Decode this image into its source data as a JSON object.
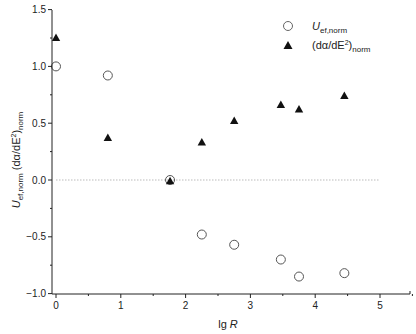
{
  "chart_data": {
    "type": "scatter",
    "title": "",
    "xlabel": "lg R",
    "ylabel": "U_ef,norm (dα/dE²)_norm",
    "xlim": [
      -0.1,
      5.5
    ],
    "ylim": [
      -1.0,
      1.5
    ],
    "xticks": [
      "0",
      "1",
      "2",
      "3",
      "4",
      "5"
    ],
    "yticks": [
      "1.5",
      "1.0",
      "0.5",
      "0.0",
      "-0.5",
      "-1.0"
    ],
    "grid": false,
    "reference_line": {
      "y": 0.0,
      "style": "dotted",
      "x_range": [
        0,
        5
      ]
    },
    "legend_position": "upper right",
    "series": [
      {
        "name": "U_ef,norm",
        "marker": "open-circle",
        "x": [
          0.0,
          0.8,
          1.76,
          2.25,
          2.75,
          3.47,
          3.75,
          4.45
        ],
        "y": [
          1.0,
          0.92,
          0.0,
          -0.48,
          -0.57,
          -0.7,
          -0.85,
          -0.82
        ]
      },
      {
        "name": "(dα/dE²)_norm",
        "marker": "filled-triangle",
        "x": [
          0.0,
          0.8,
          1.76,
          2.25,
          2.75,
          3.47,
          3.75,
          4.45
        ],
        "y": [
          1.25,
          0.37,
          -0.01,
          0.33,
          0.52,
          0.66,
          0.62,
          0.74
        ]
      }
    ]
  },
  "legend": {
    "items": [
      {
        "main": "U",
        "sub": "ef,norm",
        "marker": "open-circle"
      },
      {
        "main": "(dα/dE",
        "sup": "2",
        "close": ")",
        "sub": "norm",
        "marker": "filled-triangle"
      }
    ]
  },
  "axes": {
    "x_title_main": "lg ",
    "x_title_italic": "R",
    "y_title": {
      "u": "U",
      "u_sub": "ef,norm",
      "rest": " (dα/dE",
      "sup": "2",
      "close": ")",
      "sub": "norm"
    }
  },
  "colors": {
    "axis": "#222222",
    "marker": "#111111",
    "circle_stroke": "#555555",
    "refline": "#bbbbbb"
  }
}
